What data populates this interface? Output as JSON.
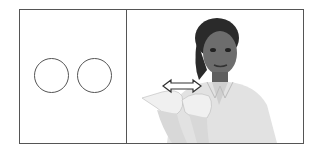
{
  "figure": {
    "left_panel": {
      "shapes": [
        {
          "type": "circle",
          "label": "circle-1"
        },
        {
          "type": "circle",
          "label": "circle-2"
        }
      ]
    },
    "right_panel": {
      "content": "photo of person signing with both hands, double-headed arrow above hands",
      "arrow": "left-right"
    },
    "colors": {
      "border": "#555555",
      "background": "#ffffff"
    }
  }
}
